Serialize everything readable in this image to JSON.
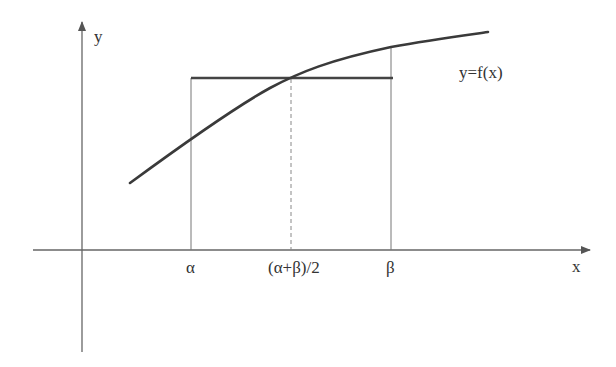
{
  "diagram": {
    "axes": {
      "x_label": "x",
      "y_label": "y",
      "color": "#555555"
    },
    "curve": {
      "label": "y=f(x)",
      "color": "#333333"
    },
    "ticks": {
      "alpha": "α",
      "midpoint": "(α+β)/2",
      "beta": "β"
    },
    "horizontal_segment": {
      "description": "chord at f((α+β)/2)",
      "color": "#333333"
    }
  }
}
